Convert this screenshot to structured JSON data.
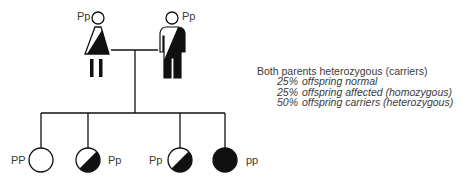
{
  "colors": {
    "ink": "#111111",
    "text": "#3a3a3a",
    "background": "#ffffff"
  },
  "parents": {
    "mother": {
      "genotype": "Pp",
      "status": "carrier"
    },
    "father": {
      "genotype": "Pp",
      "status": "carrier"
    }
  },
  "offspring": [
    {
      "genotype": "PP",
      "status": "normal"
    },
    {
      "genotype": "Pp",
      "status": "carrier"
    },
    {
      "genotype": "Pp",
      "status": "carrier"
    },
    {
      "genotype": "pp",
      "status": "affected"
    }
  ],
  "legend": {
    "title": "Both parents heterozygous (carriers)",
    "rows": [
      {
        "pct": "25%",
        "desc": "offspring normal"
      },
      {
        "pct": "25%",
        "desc": "offspring affected (homozygous)"
      },
      {
        "pct": "50%",
        "desc": "offspring carriers (heterozygous)"
      }
    ]
  }
}
